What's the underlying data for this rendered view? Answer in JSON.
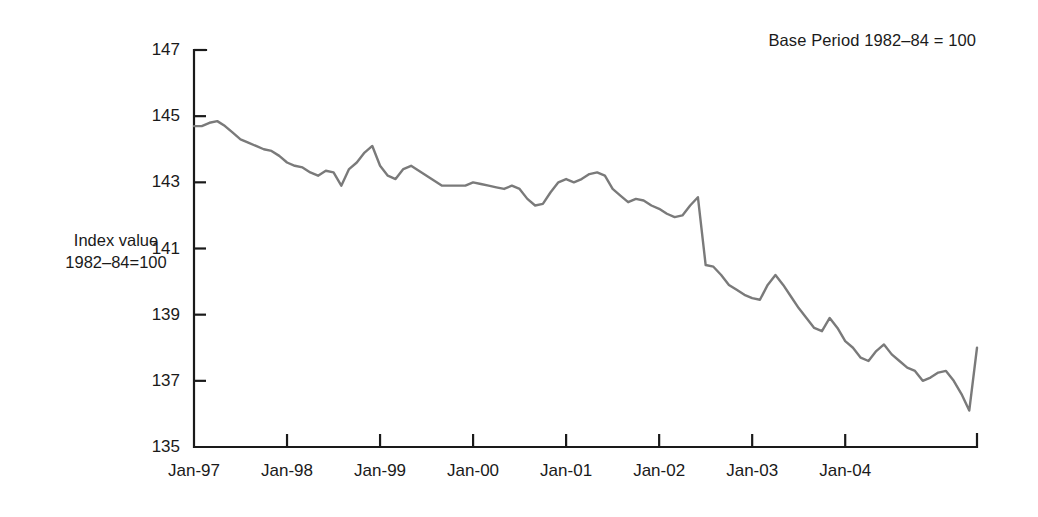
{
  "annotations": {
    "base_period_note": "Base Period 1982–84 = 100"
  },
  "axis_title": {
    "line1": "Index value",
    "line2": "1982–84=100"
  },
  "chart_data": {
    "type": "line",
    "title": "",
    "subtitle": "",
    "xlabel": "",
    "ylabel": "Index value 1982–84=100",
    "annotation": "Base Period 1982–84 = 100",
    "grid": false,
    "legend": false,
    "legend_position": "none",
    "line_color": "#7a7a7a",
    "axis_color": "#1a1a1a",
    "background_color": "#ffffff",
    "ylim": [
      135,
      147
    ],
    "ytick_labels": [
      "135",
      "137",
      "139",
      "141",
      "143",
      "145",
      "147"
    ],
    "yticks": [
      135,
      137,
      139,
      141,
      143,
      145,
      147
    ],
    "xtick_labels": [
      "Jan-97",
      "Jan-98",
      "Jan-99",
      "Jan-00",
      "Jan-01",
      "Jan-02",
      "Jan-03",
      "Jan-04"
    ],
    "xticks": [
      "1997-01",
      "1998-01",
      "1999-01",
      "2000-01",
      "2001-01",
      "2002-01",
      "2003-01",
      "2004-01"
    ],
    "xlim": [
      "1997-01",
      "2005-06"
    ],
    "x": [
      "1997-01",
      "1997-02",
      "1997-03",
      "1997-04",
      "1997-05",
      "1997-06",
      "1997-07",
      "1997-08",
      "1997-09",
      "1997-10",
      "1997-11",
      "1997-12",
      "1998-01",
      "1998-02",
      "1998-03",
      "1998-04",
      "1998-05",
      "1998-06",
      "1998-07",
      "1998-08",
      "1998-09",
      "1998-10",
      "1998-11",
      "1998-12",
      "1999-01",
      "1999-02",
      "1999-03",
      "1999-04",
      "1999-05",
      "1999-06",
      "1999-07",
      "1999-08",
      "1999-09",
      "1999-10",
      "1999-11",
      "1999-12",
      "2000-01",
      "2000-02",
      "2000-03",
      "2000-04",
      "2000-05",
      "2000-06",
      "2000-07",
      "2000-08",
      "2000-09",
      "2000-10",
      "2000-11",
      "2000-12",
      "2001-01",
      "2001-02",
      "2001-03",
      "2001-04",
      "2001-05",
      "2001-06",
      "2001-07",
      "2001-08",
      "2001-09",
      "2001-10",
      "2001-11",
      "2001-12",
      "2002-01",
      "2002-02",
      "2002-03",
      "2002-04",
      "2002-05",
      "2002-06",
      "2002-07",
      "2002-08",
      "2002-09",
      "2002-10",
      "2002-11",
      "2002-12",
      "2003-01",
      "2003-02",
      "2003-03",
      "2003-04",
      "2003-05",
      "2003-06",
      "2003-07",
      "2003-08",
      "2003-09",
      "2003-10",
      "2003-11",
      "2003-12",
      "2004-01",
      "2004-02",
      "2004-03",
      "2004-04",
      "2004-05",
      "2004-06",
      "2004-07",
      "2004-08",
      "2004-09",
      "2004-10",
      "2004-11",
      "2004-12",
      "2005-01",
      "2005-02",
      "2005-03",
      "2005-04",
      "2005-05",
      "2005-06"
    ],
    "values": [
      144.7,
      144.7,
      144.8,
      144.85,
      144.7,
      144.5,
      144.3,
      144.2,
      144.1,
      144.0,
      143.95,
      143.8,
      143.6,
      143.5,
      143.45,
      143.3,
      143.2,
      143.35,
      143.3,
      142.9,
      143.4,
      143.6,
      143.9,
      144.1,
      143.5,
      143.2,
      143.1,
      143.4,
      143.5,
      143.35,
      143.2,
      143.05,
      142.9,
      142.9,
      142.9,
      142.9,
      143.0,
      142.95,
      142.9,
      142.85,
      142.8,
      142.9,
      142.8,
      142.5,
      142.3,
      142.35,
      142.7,
      143.0,
      143.1,
      143.0,
      143.1,
      143.25,
      143.3,
      143.2,
      142.8,
      142.6,
      142.4,
      142.5,
      142.45,
      142.3,
      142.2,
      142.05,
      141.95,
      142.0,
      142.3,
      142.55,
      140.5,
      140.45,
      140.2,
      139.9,
      139.75,
      139.6,
      139.5,
      139.45,
      139.9,
      140.2,
      139.9,
      139.55,
      139.2,
      138.9,
      138.6,
      138.5,
      138.9,
      138.6,
      138.2,
      138.0,
      137.7,
      137.6,
      137.9,
      138.1,
      137.8,
      137.6,
      137.4,
      137.3,
      137.0,
      137.1,
      137.25,
      137.3,
      137.0,
      136.6,
      136.1,
      138.0
    ]
  }
}
